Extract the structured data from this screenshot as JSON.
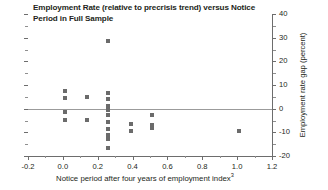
{
  "chart_data": {
    "type": "scatter",
    "title": "Employment Rate (relative to precrisis trend) versus Notice Period in Full Sample",
    "title_lines": [
      "Employment Rate (relative to precrisis trend) versus Notice",
      "Period in Full Sample"
    ],
    "xlabel": "Notice period after four years of employment index",
    "xlabel_superscript": "3",
    "ylabel": "Employment rate gap (percent)",
    "xlim": [
      -0.2,
      1.2
    ],
    "ylim": [
      -20,
      40
    ],
    "x_ticks": [
      -0.2,
      0.0,
      0.2,
      0.4,
      0.6,
      0.8,
      1.0,
      1.2
    ],
    "x_tick_labels": [
      "-0.2",
      "0.0",
      "0.2",
      "0.4",
      "0.6",
      "0.8",
      "1.0",
      "1.2"
    ],
    "x_minor_ticks": [
      -0.1,
      0.1,
      0.3,
      0.5,
      0.7,
      0.9,
      1.1
    ],
    "y_ticks": [
      -20,
      -10,
      0,
      10,
      20,
      30,
      40
    ],
    "y_tick_labels": [
      "-20",
      "-10",
      "0",
      "10",
      "20",
      "30",
      "40"
    ],
    "y_minor_ticks": [
      -15,
      -5,
      5,
      15,
      25,
      35
    ],
    "y_axis_position": "right",
    "grid": false,
    "legend": false,
    "zero_line": 0,
    "marker_color": "#6b6b6b",
    "axis_color": "#6d6d6d",
    "zero_line_color": "#9b9b9b",
    "points": [
      {
        "x": 0.01,
        "y": 7.6
      },
      {
        "x": 0.01,
        "y": 4.6
      },
      {
        "x": 0.01,
        "y": -1.4
      },
      {
        "x": 0.01,
        "y": -4.6
      },
      {
        "x": 0.14,
        "y": 5.0
      },
      {
        "x": 0.14,
        "y": -4.6
      },
      {
        "x": 0.26,
        "y": 28.5
      },
      {
        "x": 0.26,
        "y": 6.6
      },
      {
        "x": 0.26,
        "y": 4.0
      },
      {
        "x": 0.26,
        "y": 1.0
      },
      {
        "x": 0.26,
        "y": -0.4
      },
      {
        "x": 0.26,
        "y": -2.6
      },
      {
        "x": 0.26,
        "y": -5.6
      },
      {
        "x": 0.26,
        "y": -8.4
      },
      {
        "x": 0.26,
        "y": -11.0
      },
      {
        "x": 0.26,
        "y": -13.0
      },
      {
        "x": 0.26,
        "y": -16.6
      },
      {
        "x": 0.39,
        "y": -6.4
      },
      {
        "x": 0.39,
        "y": -9.4
      },
      {
        "x": 0.51,
        "y": -2.6
      },
      {
        "x": 0.51,
        "y": -6.8
      },
      {
        "x": 0.51,
        "y": -8.2
      },
      {
        "x": 1.01,
        "y": -9.4
      }
    ]
  }
}
